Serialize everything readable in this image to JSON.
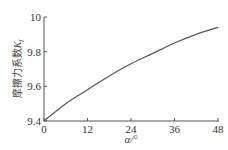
{
  "chart_data": {
    "type": "line",
    "title": "",
    "xlabel": "α/°",
    "ylabel": "摩擦力系数K_f",
    "ylabel_main": "摩擦力系数",
    "ylabel_symbol": "K",
    "ylabel_subscript": "f",
    "xlim": [
      0,
      48
    ],
    "ylim": [
      9.4,
      10.0
    ],
    "xticks": [
      0,
      12,
      24,
      36,
      48
    ],
    "xtick_labels": [
      "0",
      "12",
      "24",
      "36",
      "48"
    ],
    "yticks": [
      9.4,
      9.6,
      9.8,
      10.0
    ],
    "ytick_labels": [
      "9.4",
      "9.6",
      "9.8",
      "10"
    ],
    "grid": false,
    "legend": null,
    "series": [
      {
        "name": "K_f",
        "color": "#555555",
        "x": [
          0,
          6,
          12,
          18,
          24,
          30,
          36,
          42,
          48
        ],
        "values": [
          9.4,
          9.5,
          9.58,
          9.66,
          9.73,
          9.79,
          9.85,
          9.9,
          9.94
        ]
      }
    ]
  },
  "style": {
    "axis_color": "#555555",
    "line_color": "#555555"
  }
}
